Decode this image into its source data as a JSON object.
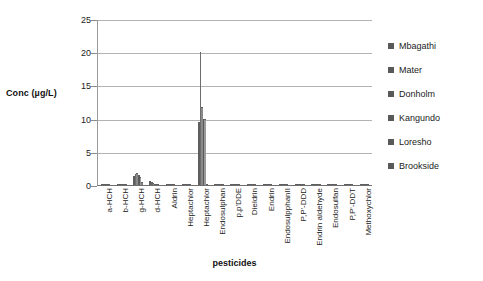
{
  "chart_data": {
    "type": "bar",
    "title": "",
    "xlabel": "pesticides",
    "ylabel": "Conc (µg/L)",
    "ylim": [
      0,
      25
    ],
    "yticks": [
      0,
      5,
      10,
      15,
      20,
      25
    ],
    "grid": true,
    "legend_position": "right",
    "categories": [
      "a-HCH",
      "b-HCH",
      "g-HCH",
      "d-HCH",
      "Aldrin",
      "Heptachlor",
      "Heptachlor",
      "Endosulphan",
      "p,p'DDE",
      "Dieldrin",
      "Endrin",
      "EndosulpphanII",
      "P,P'-DDD",
      "Endrin aldehyde",
      "Endosulfan",
      "P,P'-DDT",
      "Methoxychlor"
    ],
    "series": [
      {
        "name": "Mbagathi",
        "values": [
          0.05,
          0.1,
          1.4,
          0.6,
          0,
          0,
          9.5,
          0.15,
          0,
          0,
          0,
          0,
          0,
          0,
          0,
          0,
          0
        ]
      },
      {
        "name": "Mater",
        "values": [
          0.05,
          0.05,
          1.7,
          0.5,
          0,
          0,
          20.1,
          0.1,
          0,
          0,
          0,
          0,
          0,
          0,
          0,
          0,
          0
        ]
      },
      {
        "name": "Donholm",
        "values": [
          0.05,
          0.05,
          1.8,
          0.35,
          0,
          0,
          11.7,
          0.1,
          0,
          0,
          0,
          0,
          0,
          0,
          0,
          0,
          0
        ]
      },
      {
        "name": "Kangundo",
        "values": [
          0.05,
          0.05,
          1.5,
          0.2,
          0,
          0,
          10.0,
          0.1,
          0,
          0,
          0,
          0,
          0,
          0,
          0,
          0,
          0
        ]
      },
      {
        "name": "Loresho",
        "values": [
          0.05,
          0.05,
          1.2,
          0.15,
          0,
          0,
          9.9,
          0.1,
          0,
          0,
          0,
          0,
          0,
          0,
          0,
          0,
          0
        ]
      },
      {
        "name": "Brookside",
        "values": [
          0.05,
          0.05,
          0.5,
          0.1,
          0,
          0,
          0.2,
          0.1,
          0,
          0,
          0,
          0,
          0,
          0,
          0,
          0,
          0
        ]
      }
    ]
  },
  "axes": {
    "y_title": "Conc (µg/L)",
    "x_title": "pesticides"
  },
  "legend": {
    "items": [
      {
        "label": "Mbagathi",
        "color": "#595959"
      },
      {
        "label": "Mater",
        "color": "#595959"
      },
      {
        "label": "Donholm",
        "color": "#595959"
      },
      {
        "label": "Kangundo",
        "color": "#595959"
      },
      {
        "label": "Loresho",
        "color": "#595959"
      },
      {
        "label": "Brookside",
        "color": "#595959"
      }
    ]
  }
}
